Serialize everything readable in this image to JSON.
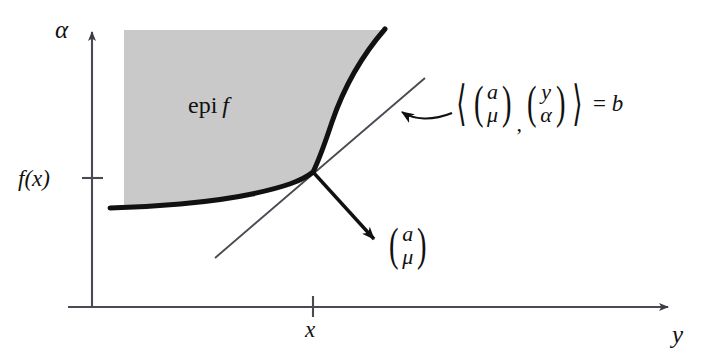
{
  "figure": {
    "kind": "convex-analysis-epigraph-supporting-hyperplane-diagram",
    "background_color": "#ffffff",
    "width": 707,
    "height": 360
  },
  "axes": {
    "vertical_label": "α",
    "horizontal_label": "y",
    "origin": {
      "x": 92,
      "y": 307
    },
    "color": "#4a4a52",
    "vertical_tick_label": "f(x)",
    "vertical_tick_y": 178,
    "horizontal_tick_label": "x",
    "horizontal_tick_x": 313
  },
  "region": {
    "label_prefix": "epi",
    "label_function": "f",
    "fill_color": "#c9c9c9",
    "label_x": 188,
    "label_y": 93
  },
  "curve": {
    "name": "epigraph-boundary",
    "color": "#111111",
    "stroke_width": 5
  },
  "tangency_point": {
    "x": 313,
    "y": 172
  },
  "hyperplane": {
    "name": "supporting-hyperplane-line",
    "color": "#4a4a52",
    "equation": {
      "left_bracket": "⟨",
      "right_bracket": "⟩",
      "vector_one_top": "a",
      "vector_one_bottom": "μ",
      "separator": ",",
      "vector_two_top": "y",
      "vector_two_bottom": "α",
      "relation": "=",
      "right_hand_side": "b"
    },
    "label_x": 452,
    "label_y": 80
  },
  "normal_vector": {
    "name": "normal-vector-arrow",
    "color": "#111111",
    "top_component": "a",
    "bottom_component": "μ",
    "label_x": 386,
    "label_y": 222,
    "tip": {
      "x": 378,
      "y": 243
    }
  },
  "pointer_arrow": {
    "name": "hyperplane-callout-arrow",
    "color": "#111111",
    "tip": {
      "x": 398,
      "y": 110
    }
  }
}
